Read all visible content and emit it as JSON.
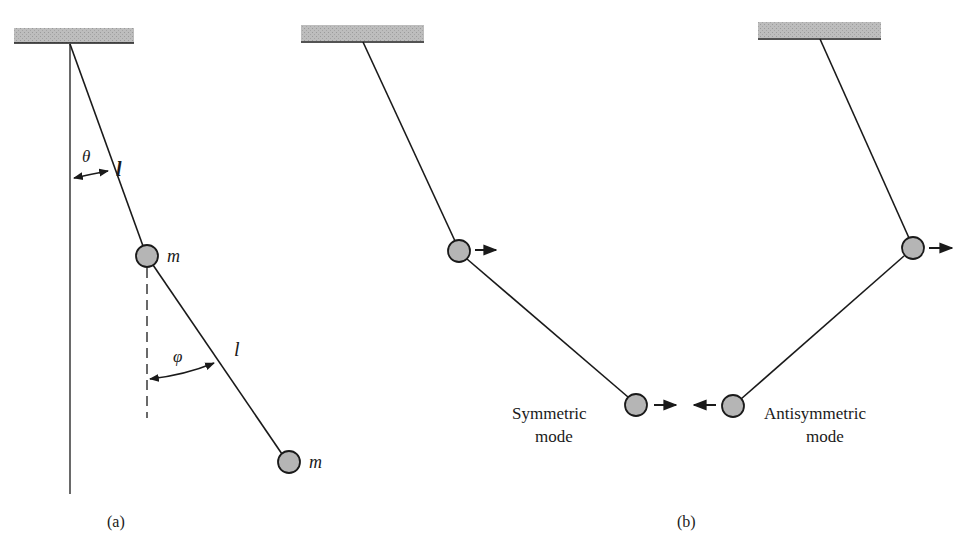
{
  "figure": {
    "panel_a": {
      "caption": "(a)",
      "theta_label": "θ",
      "phi_label": "φ",
      "length_label_upper": "l",
      "length_label_lower": "l",
      "mass_label_upper": "m",
      "mass_label_lower": "m"
    },
    "panel_b": {
      "caption": "(b)",
      "symmetric_label_line1": "Symmetric",
      "symmetric_label_line2": "mode",
      "antisymmetric_label_line1": "Antisymmetric",
      "antisymmetric_label_line2": "mode"
    },
    "colors": {
      "support": "#b8b8b8",
      "mass_fill": "#b5b5b5",
      "line": "#1a1a1a"
    }
  }
}
